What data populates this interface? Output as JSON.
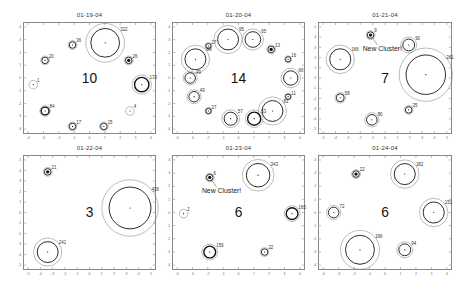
{
  "chart_data": [
    {
      "type": "scatter",
      "title": "01-19-04",
      "cluster_count": "10",
      "annotations": [],
      "clusters": [
        {
          "label": "322",
          "x": 62,
          "y": 18,
          "r": 11,
          "rings": 2
        },
        {
          "label": "36",
          "x": 37,
          "y": 20,
          "r": 2.5,
          "rings": 2
        },
        {
          "label": "20",
          "x": 16,
          "y": 34,
          "r": 2.5,
          "rings": 2
        },
        {
          "label": "26",
          "x": 80,
          "y": 34,
          "r": 2.5,
          "rings": 2,
          "filled": true
        },
        {
          "label": "1",
          "x": 7,
          "y": 56,
          "r": 3,
          "rings": 1
        },
        {
          "label": "173",
          "x": 90,
          "y": 56,
          "r": 5.5,
          "rings": 3
        },
        {
          "label": "84",
          "x": 16,
          "y": 80,
          "r": 3,
          "rings": 3
        },
        {
          "label": "4",
          "x": 81,
          "y": 80,
          "r": 3,
          "rings": 1
        },
        {
          "label": "17",
          "x": 37,
          "y": 94,
          "r": 2.5,
          "rings": 2
        },
        {
          "label": "15",
          "x": 61,
          "y": 94,
          "r": 2.5,
          "rings": 2
        }
      ],
      "xlim": [
        -4,
        4
      ],
      "ylim": [
        -4,
        4
      ]
    },
    {
      "type": "scatter",
      "title": "01-20-04",
      "cluster_count": "14",
      "annotations": [],
      "clusters": [
        {
          "label": "95",
          "x": 42,
          "y": 15,
          "r": 8,
          "rings": 2
        },
        {
          "label": "65",
          "x": 61,
          "y": 15,
          "r": 6,
          "rings": 2
        },
        {
          "label": "27",
          "x": 27,
          "y": 21,
          "r": 2,
          "rings": 2
        },
        {
          "label": "13",
          "x": 75,
          "y": 24,
          "r": 2.5,
          "rings": 2,
          "filled": true
        },
        {
          "label": "89",
          "x": 17,
          "y": 33,
          "r": 8,
          "rings": 2
        },
        {
          "label": "16",
          "x": 88,
          "y": 33,
          "r": 2,
          "rings": 2
        },
        {
          "label": "49",
          "x": 13,
          "y": 50,
          "r": 4,
          "rings": 2
        },
        {
          "label": "66",
          "x": 90,
          "y": 50,
          "r": 5.5,
          "rings": 2
        },
        {
          "label": "49",
          "x": 16,
          "y": 67,
          "r": 4,
          "rings": 2
        },
        {
          "label": "11",
          "x": 88,
          "y": 67,
          "r": 2,
          "rings": 2
        },
        {
          "label": "27",
          "x": 27,
          "y": 80,
          "r": 2,
          "rings": 2
        },
        {
          "label": "81",
          "x": 76,
          "y": 80,
          "r": 8,
          "rings": 2
        },
        {
          "label": "57",
          "x": 44,
          "y": 87,
          "r": 5,
          "rings": 2
        },
        {
          "label": "53",
          "x": 62,
          "y": 87,
          "r": 5,
          "rings": 3
        }
      ],
      "xlim": [
        -4,
        4
      ],
      "ylim": [
        -4,
        4
      ]
    },
    {
      "type": "scatter",
      "title": "01-21-04",
      "cluster_count": "7",
      "annotations": [
        "New Cluster!"
      ],
      "clusters": [
        {
          "label": "9",
          "x": 39,
          "y": 11,
          "r": 2.5,
          "rings": 2,
          "filled": true,
          "new": true
        },
        {
          "label": "90",
          "x": 68,
          "y": 20,
          "r": 4.5,
          "rings": 2
        },
        {
          "label": "166",
          "x": 16,
          "y": 33,
          "r": 8,
          "rings": 2
        },
        {
          "label": "261",
          "x": 81,
          "y": 47,
          "r": 15,
          "rings": 2
        },
        {
          "label": "58",
          "x": 16,
          "y": 68,
          "r": 3,
          "rings": 2
        },
        {
          "label": "80",
          "x": 40,
          "y": 88,
          "r": 4,
          "rings": 2
        },
        {
          "label": "35",
          "x": 68,
          "y": 79,
          "r": 2.5,
          "rings": 2
        }
      ],
      "xlim": [
        -5,
        5
      ],
      "ylim": [
        -5,
        5
      ]
    },
    {
      "type": "scatter",
      "title": "01-22-04",
      "cluster_count": "3",
      "annotations": [],
      "clusters": [
        {
          "label": "21",
          "x": 18,
          "y": 14,
          "r": 2.5,
          "rings": 2,
          "filled": true
        },
        {
          "label": "436",
          "x": 81,
          "y": 46,
          "r": 16,
          "rings": 2
        },
        {
          "label": "241",
          "x": 18,
          "y": 85,
          "r": 8,
          "rings": 2
        }
      ],
      "xlim": [
        -5,
        5
      ],
      "ylim": [
        -5,
        5
      ]
    },
    {
      "type": "scatter",
      "title": "01-23-04",
      "cluster_count": "6",
      "annotations": [
        "New Cluster!"
      ],
      "clusters": [
        {
          "label": "343",
          "x": 65,
          "y": 17,
          "r": 9,
          "rings": 2
        },
        {
          "label": "6",
          "x": 28,
          "y": 19,
          "r": 2.5,
          "rings": 2,
          "filled": true,
          "new": true
        },
        {
          "label": "2",
          "x": 8,
          "y": 51,
          "r": 3,
          "rings": 1
        },
        {
          "label": "165",
          "x": 91,
          "y": 51,
          "r": 4.5,
          "rings": 3
        },
        {
          "label": "159",
          "x": 28,
          "y": 85,
          "r": 4.5,
          "rings": 3
        },
        {
          "label": "22",
          "x": 70,
          "y": 85,
          "r": 2.5,
          "rings": 2
        }
      ],
      "xlim": [
        -4,
        4
      ],
      "ylim": [
        -4,
        4
      ]
    },
    {
      "type": "scatter",
      "title": "01-24-04",
      "cluster_count": "6",
      "annotations": [],
      "clusters": [
        {
          "label": "22",
          "x": 28,
          "y": 16,
          "r": 2.5,
          "rings": 2,
          "filled": true
        },
        {
          "label": "182",
          "x": 65,
          "y": 16,
          "r": 8,
          "rings": 2
        },
        {
          "label": "72",
          "x": 11,
          "y": 50,
          "r": 4,
          "rings": 2
        },
        {
          "label": "151",
          "x": 87,
          "y": 50,
          "r": 8,
          "rings": 2
        },
        {
          "label": "196",
          "x": 31,
          "y": 83,
          "r": 11,
          "rings": 2
        },
        {
          "label": "94",
          "x": 65,
          "y": 83,
          "r": 4.5,
          "rings": 2
        }
      ],
      "xlim": [
        -4,
        4
      ],
      "ylim": [
        -4,
        4
      ]
    }
  ],
  "layout": {
    "panels": [
      {
        "left": 23,
        "top": 22,
        "width": 133,
        "height": 112
      },
      {
        "left": 172,
        "top": 22,
        "width": 133,
        "height": 112
      },
      {
        "left": 318,
        "top": 22,
        "width": 134,
        "height": 112
      },
      {
        "left": 23,
        "top": 155,
        "width": 133,
        "height": 115
      },
      {
        "left": 172,
        "top": 155,
        "width": 133,
        "height": 115
      },
      {
        "left": 318,
        "top": 155,
        "width": 134,
        "height": 115
      }
    ]
  }
}
